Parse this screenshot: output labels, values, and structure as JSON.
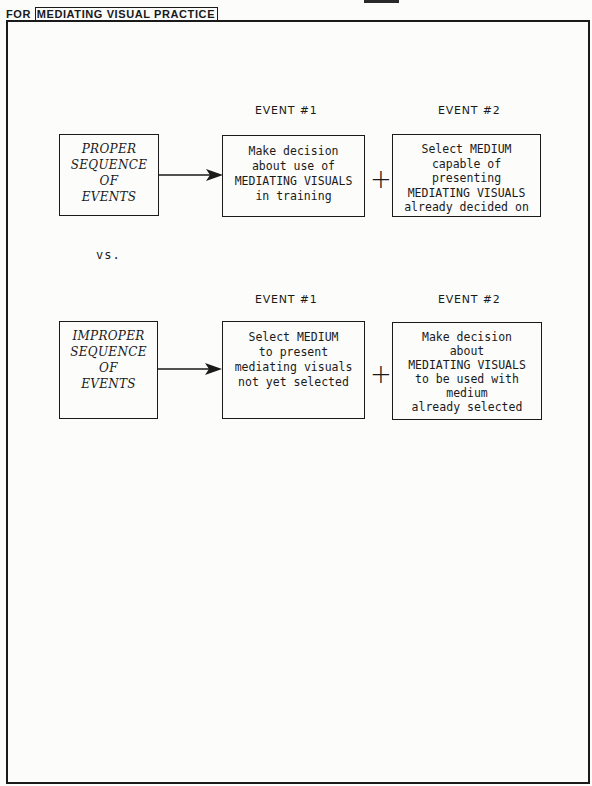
{
  "header": {
    "prefix": "FOR",
    "title": "MEDIATING VISUAL PRACTICE"
  },
  "rows": [
    {
      "label_lines": [
        "PROPER",
        "SEQUENCE",
        "OF",
        "EVENTS"
      ],
      "event1_header": "EVENT #1",
      "event2_header": "EVENT #2",
      "event1_text": "Make decision\nabout use of\nMEDIATING VISUALS\nin training",
      "event2_text": "Select MEDIUM\ncapable of\npresenting\nMEDIATING VISUALS\nalready decided on",
      "plus": "+"
    },
    {
      "label_lines": [
        "IMPROPER",
        "SEQUENCE",
        "OF",
        "EVENTS"
      ],
      "event1_header": "EVENT #1",
      "event2_header": "EVENT #2",
      "event1_text": "Select MEDIUM\nto present\nmediating visuals\nnot yet selected",
      "event2_text": "Make decision\nabout\nMEDIATING VISUALS\nto be used with\nmedium\nalready selected",
      "plus": "+"
    }
  ],
  "separator": "vs.",
  "colors": {
    "ink": "#1a1a1a",
    "paper": "#fcfcfb"
  }
}
